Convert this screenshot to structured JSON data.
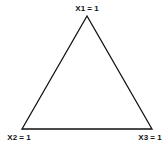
{
  "diagram": {
    "type": "ternary-simplex",
    "stroke_color": "#111111",
    "background": "#ffffff",
    "vertices": [
      {
        "id": "top",
        "label": "X1 = 1",
        "x": 87,
        "y": 16
      },
      {
        "id": "bottom-left",
        "label": "X2 = 1",
        "x": 22,
        "y": 129
      },
      {
        "id": "bottom-right",
        "label": "X3 = 1",
        "x": 152,
        "y": 129
      }
    ]
  }
}
